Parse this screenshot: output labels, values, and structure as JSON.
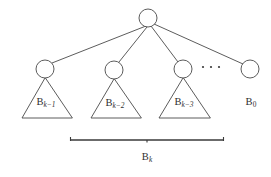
{
  "figure": {
    "type": "binomial-tree-decomposition-diagram",
    "background_color": "#ffffff",
    "stroke_color": "#4a4a4a",
    "brace_color": "#3a3a3a",
    "text_color": "#2f2f2f",
    "root": {
      "name": "root-node",
      "cx": 148,
      "cy": 18,
      "r": 9
    },
    "children": [
      {
        "name": "subtree-node-k-1",
        "cx": 45,
        "cy": 69,
        "r": 9,
        "label_base": "B",
        "label_sub": "k−1",
        "triangle": {
          "left_x": 22,
          "right_x": 72,
          "base_y": 118
        },
        "label_x": 46,
        "label_y": 103
      },
      {
        "name": "subtree-node-k-2",
        "cx": 114,
        "cy": 70,
        "r": 9,
        "label_base": "B",
        "label_sub": "k−2",
        "triangle": {
          "left_x": 91,
          "right_x": 141,
          "base_y": 118
        },
        "label_x": 115,
        "label_y": 104
      },
      {
        "name": "subtree-node-k-3",
        "cx": 183,
        "cy": 69,
        "r": 9,
        "label_base": "B",
        "label_sub": "k−3",
        "triangle": {
          "left_x": 159,
          "right_x": 210,
          "base_y": 118
        },
        "label_x": 184,
        "label_y": 103
      }
    ],
    "last_child": {
      "name": "subtree-node-0",
      "cx": 250,
      "cy": 69,
      "r": 9,
      "label_base": "B",
      "label_sub": "0",
      "label_x": 251,
      "label_y": 103
    },
    "ellipsis": {
      "name": "ellipsis-dots",
      "text": "· · ·",
      "dots": [
        {
          "cx": 203,
          "cy": 67,
          "r": 1.1
        },
        {
          "cx": 211,
          "cy": 67,
          "r": 1.1
        },
        {
          "cx": 219,
          "cy": 67,
          "r": 1.1
        }
      ]
    },
    "brace": {
      "name": "span-brace",
      "left_x": 70,
      "right_x": 224,
      "y": 140,
      "tick_height": 4,
      "label_base": "B",
      "label_sub": "k",
      "label_x": 147,
      "label_y": 158
    },
    "edges": [
      {
        "name": "edge-root-to-k-1",
        "x1": 146,
        "y1": 26,
        "x2": 52,
        "y2": 63
      },
      {
        "name": "edge-root-to-k-2",
        "x1": 147,
        "y1": 27,
        "x2": 119,
        "y2": 62
      },
      {
        "name": "edge-root-to-k-3",
        "x1": 151,
        "y1": 26,
        "x2": 178,
        "y2": 62
      },
      {
        "name": "edge-root-to-0",
        "x1": 154,
        "y1": 24,
        "x2": 243,
        "y2": 64
      }
    ]
  }
}
